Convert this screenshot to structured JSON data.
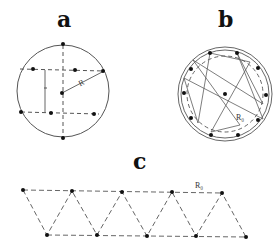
{
  "panels": {
    "a": {
      "label": "a",
      "radius_label": "R",
      "interval_label": "l",
      "description": "Circle with dashed vertical diameter and two dashed horizontal chords; dots on circle and chords; radius R from center"
    },
    "b": {
      "label": "b",
      "radius_label": "R₀",
      "description": "Two concentric solid circles with inner dashed circle; ten dots forming a zig-zag ring, center dot"
    },
    "c": {
      "label": "c",
      "radius_label": "R₀",
      "description": "Zig-zag dashed triangular strip with two rows of five dots each"
    }
  },
  "colors": {
    "stroke": "#555555",
    "dot": "#111111",
    "background": "#ffffff"
  }
}
